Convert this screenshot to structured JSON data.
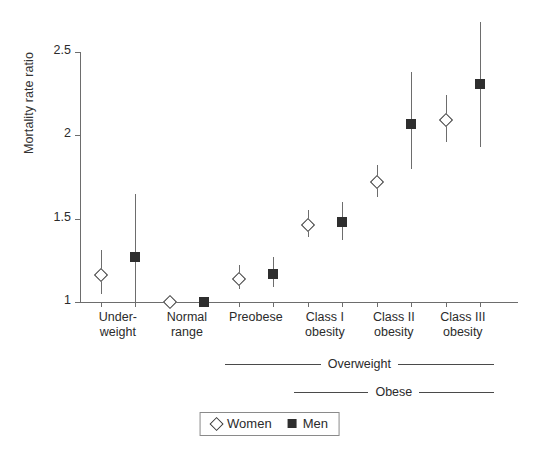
{
  "chart_data": {
    "type": "scatter",
    "title": "",
    "xlabel": "",
    "ylabel": "Mortality rate ratio",
    "ylim": [
      1,
      2.5
    ],
    "yticks": [
      1,
      1.5,
      2,
      2.5
    ],
    "ytick_labels": [
      "1",
      "1.5",
      "2",
      "2.5"
    ],
    "grid": false,
    "legend_position": "bottom-center",
    "categories": [
      "Under-\nweight",
      "Normal\nrange",
      "Preobese",
      "Class I\nobesity",
      "Class II\nobesity",
      "Class III\nobesity"
    ],
    "series": [
      {
        "name": "Women",
        "marker": "open-diamond",
        "color": "#3a3a3a",
        "values": [
          1.16,
          1.0,
          1.14,
          1.46,
          1.72,
          2.09
        ],
        "ci_low": [
          1.05,
          1.0,
          1.08,
          1.39,
          1.63,
          1.96
        ],
        "ci_high": [
          1.31,
          1.0,
          1.22,
          1.55,
          1.82,
          2.24
        ]
      },
      {
        "name": "Men",
        "marker": "filled-square",
        "color": "#2e2e2e",
        "values": [
          1.27,
          1.0,
          1.17,
          1.48,
          2.07,
          2.31
        ],
        "ci_low": [
          1.0,
          1.0,
          1.09,
          1.37,
          1.8,
          1.93
        ],
        "ci_high": [
          1.65,
          1.0,
          1.27,
          1.6,
          2.38,
          2.68
        ]
      }
    ],
    "annotations": [
      {
        "label": "Overweight",
        "from_category": 2,
        "to_category": 5
      },
      {
        "label": "Obese",
        "from_category": 3,
        "to_category": 5
      }
    ]
  },
  "legend": {
    "items": [
      {
        "label": "Women",
        "marker": "open-diamond"
      },
      {
        "label": "Men",
        "marker": "filled-square"
      }
    ]
  }
}
